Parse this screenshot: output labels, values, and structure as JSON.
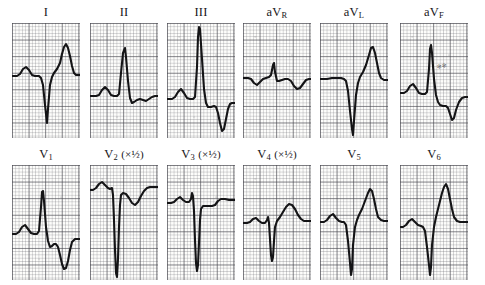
{
  "figure": {
    "kind": "12-lead-ecg",
    "rows": 2,
    "columns": 6,
    "paper_color": "#fdfdfb",
    "grid_color": "#46464e",
    "trace_color": "#141416"
  },
  "leads": [
    {
      "id": "I",
      "label_main": "I",
      "label_sub": "",
      "label_suffix": "",
      "scale": "1",
      "baseline_pct": 46,
      "morphology": "small P, deep narrow QS, tall peaked T",
      "path": "M0,53 L5,53 L8,51 L11,46 L14,44 L17,47 L20,52 L23,53 L27,53 L29,55 L31,62 L33,82 L35,100 L36,86 L38,62 L40,54 L42,50 L45,46 L48,40 L50,31 L52,24 L54,21 L56,25 L58,33 L60,43 L62,50 L64,52 L68,52"
    },
    {
      "id": "II",
      "label_main": "II",
      "label_sub": "",
      "label_suffix": "",
      "scale": "1",
      "baseline_pct": 62,
      "morphology": "P wave, tall narrow R spike, small S, low flat T",
      "path": "M0,73 L6,73 L9,72 L12,67 L15,64 L18,67 L21,72 L24,73 L27,73 L29,71 L31,50 L33,30 L35,25 L36,34 L38,58 L40,75 L42,80 L44,79 L47,77 L50,76 L53,77 L56,78 L59,76 L62,74 L65,73 L68,73"
    },
    {
      "id": "III",
      "label_main": "III",
      "label_sub": "",
      "label_suffix": "",
      "scale": "1",
      "baseline_pct": 62,
      "morphology": "very tall R reaching top, deep inverted T",
      "path": "M0,76 L5,76 L8,74 L11,69 L14,66 L17,70 L20,75 L23,76 L26,76 L28,74 L30,44 L31,14 L32,4 L33,6 L35,36 L37,66 L39,80 L41,84 L44,84 L47,83 L49,84 L51,90 L53,100 L55,108 L57,106 L59,96 L61,86 L63,81 L65,80 L68,80"
    },
    {
      "id": "aVR",
      "label_main": "aV",
      "label_sub": "R",
      "label_suffix": "",
      "scale": "1",
      "baseline_pct": 50,
      "morphology": "low amplitude, inverted P, small spike, shallow inverted T",
      "path": "M0,55 L5,55 L8,56 L11,60 L14,62 L17,59 L20,56 L23,55 L26,54 L28,52 L30,42 L31,40 L32,49 L34,58 L36,58 L39,57 L42,56 L45,56 L48,58 L51,63 L54,66 L57,65 L60,61 L63,57 L66,56 L68,56"
    },
    {
      "id": "aVL",
      "label_main": "aV",
      "label_sub": "L",
      "label_suffix": "",
      "scale": "1",
      "baseline_pct": 48,
      "morphology": "deep QS to bottom, tall rounded T",
      "path": "M0,56 L7,56 L12,55 L17,55 L21,55 L24,56 L26,58 L28,68 L30,88 L32,106 L33,112 L34,98 L36,72 L38,60 L40,54 L43,49 L46,42 L49,32 L51,25 L53,24 L55,30 L57,40 L59,50 L61,55 L64,57 L68,57"
    },
    {
      "id": "aVF",
      "label_main": "aV",
      "label_sub": "F",
      "label_suffix": "",
      "scale": "1",
      "baseline_pct": 58,
      "morphology": "P wave, tall R spike, negative T dip",
      "path": "M0,70 L4,70 L7,68 L10,63 L13,61 L16,65 L19,70 L22,71 L25,71 L27,69 L29,46 L30,26 L31,22 L32,30 L34,56 L36,72 L38,79 L40,82 L43,83 L46,83 L48,85 L50,91 L52,97 L54,95 L56,87 L59,79 L62,75 L65,74 L68,74"
    },
    {
      "id": "V1",
      "label_main": "V",
      "label_sub": "1",
      "label_suffix": "",
      "scale": "1",
      "baseline_pct": 58,
      "morphology": "P wave, tall R, small S, deep inverted T",
      "path": "M0,69 L4,69 L7,67 L10,62 L13,60 L16,64 L19,68 L22,69 L25,69 L27,66 L29,42 L30,27 L31,26 L32,36 L34,62 L36,76 L38,82 L40,81 L42,79 L44,79 L46,82 L48,90 L50,99 L52,104 L54,103 L56,96 L58,85 L60,77 L63,74 L66,74 L68,74"
    },
    {
      "id": "V2",
      "label_main": "V",
      "label_sub": "2",
      "label_suffix": "(×½)",
      "scale": "0.5",
      "baseline_pct": 20,
      "morphology": "high baseline, two very deep S waves to bottom",
      "path": "M0,25 L3,25 L6,23 L9,19 L12,17 L15,20 L18,23 L20,24 L22,23 L23,30 L24,55 L25,85 L26,108 L27,112 L28,94 L29,62 L30,40 L31,30 L33,28 L36,29 L39,33 L42,38 L45,40 L48,37 L51,31 L54,26 L57,23 L60,22 L63,22 L66,22 L68,22"
    },
    {
      "id": "V3",
      "label_main": "V",
      "label_sub": "3",
      "label_suffix": "(×½)",
      "scale": "0.5",
      "baseline_pct": 31,
      "morphology": "high baseline, small R then very deep S",
      "path": "M0,38 L4,38 L7,37 L10,34 L13,32 L16,35 L19,37 L22,37 L24,34 L25,28 L26,31 L27,46 L28,75 L29,98 L30,106 L31,100 L32,78 L33,55 L34,44 L36,41 L39,41 L42,41 L45,41 L48,40 L51,36 L54,34 L58,34 L62,35 L65,35 L68,35"
    },
    {
      "id": "V4",
      "label_main": "V",
      "label_sub": "4",
      "label_suffix": "(×½)",
      "scale": "0.5",
      "baseline_pct": 48,
      "morphology": "P wave, small notch, deep S, broad positive T",
      "path": "M0,58 L4,58 L7,57 L10,54 L13,53 L16,56 L19,58 L22,58 L24,55 L25,52 L26,58 L27,74 L28,90 L29,96 L30,92 L31,76 L32,62 L34,56 L37,52 L40,47 L43,42 L46,39 L49,40 L52,44 L55,50 L58,54 L61,56 L64,56 L68,56"
    },
    {
      "id": "V5",
      "label_main": "V",
      "label_sub": "5",
      "label_suffix": "",
      "scale": "1",
      "baseline_pct": 48,
      "morphology": "P wave, deep QS to bottom, tall peaked T",
      "path": "M0,57 L4,57 L7,55 L10,51 L13,49 L16,53 L19,56 L22,57 L24,57 L26,60 L28,76 L30,98 L31,110 L32,104 L33,80 L35,62 L37,55 L39,50 L42,44 L45,36 L48,28 L50,24 L52,26 L54,34 L56,44 L58,52 L61,55 L64,56 L68,56"
    },
    {
      "id": "V6",
      "label_main": "V",
      "label_sub": "6",
      "label_suffix": "",
      "scale": "1",
      "baseline_pct": 50,
      "morphology": "broad P, deep narrow QS, very tall peaked T",
      "path": "M0,62 L3,62 L6,60 L9,56 L12,54 L15,57 L18,60 L21,61 L23,62 L25,66 L27,82 L29,100 L30,110 L31,102 L32,80 L34,62 L36,52 L38,44 L40,36 L42,28 L44,22 L46,19 L48,24 L50,34 L52,44 L54,52 L57,56 L60,57 L64,57 L68,57"
    }
  ],
  "annotations": [
    {
      "lead": "aVF",
      "text": "✻✻",
      "x_pct": 55,
      "y_pct": 34
    }
  ]
}
